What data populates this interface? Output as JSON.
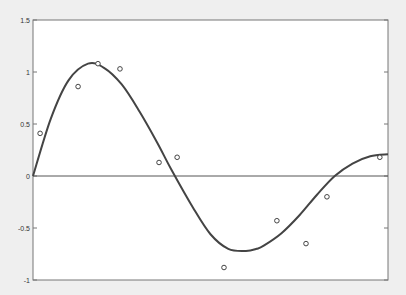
{
  "chart_data": {
    "type": "line",
    "title": "",
    "xlabel": "",
    "ylabel": "",
    "ylim": [
      -1,
      1.5
    ],
    "xlim": [
      0,
      1
    ],
    "grid": false,
    "legend": null,
    "yticks": [
      -1,
      -0.5,
      0,
      0.5,
      1,
      1.5
    ],
    "ytick_labels": [
      "-1",
      "-0.5",
      "0",
      "0.5",
      "1",
      "1.5"
    ],
    "xticks": [],
    "reference_line": {
      "y": 0,
      "color": "#555555"
    },
    "series": [
      {
        "name": "fitted curve",
        "kind": "line",
        "color": "#444444",
        "x": [
          0.0,
          0.05,
          0.1,
          0.155,
          0.2,
          0.25,
          0.3,
          0.35,
          0.4,
          0.39,
          0.45,
          0.5,
          0.55,
          0.6,
          0.63,
          0.65,
          0.7,
          0.75,
          0.8,
          0.85,
          0.9,
          0.95,
          1.0
        ],
        "y": [
          0.0,
          0.55,
          0.92,
          1.08,
          1.04,
          0.88,
          0.62,
          0.32,
          0.02,
          0.06,
          -0.3,
          -0.56,
          -0.7,
          -0.72,
          -0.7,
          -0.67,
          -0.55,
          -0.38,
          -0.18,
          0.0,
          0.12,
          0.19,
          0.21
        ]
      },
      {
        "name": "data points",
        "kind": "scatter",
        "color": "#444444",
        "marker": "circle-open",
        "x": [
          0.02,
          0.127,
          0.183,
          0.245,
          0.355,
          0.406,
          0.538,
          0.687,
          0.769,
          0.828,
          0.977
        ],
        "y": [
          0.41,
          0.86,
          1.08,
          1.03,
          0.13,
          0.18,
          -0.88,
          -0.43,
          -0.65,
          -0.2,
          0.18
        ]
      }
    ]
  }
}
